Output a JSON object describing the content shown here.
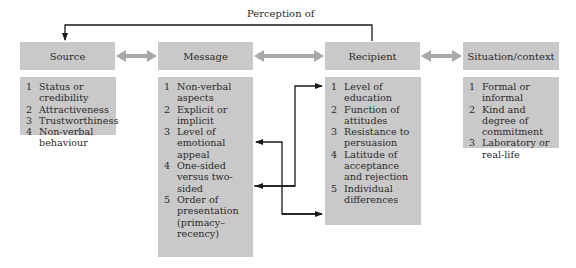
{
  "diagram": {
    "feedback_label": "Perception of",
    "colors": {
      "box": "#c9c9c9",
      "double_arrow": "#a9a9a9",
      "line": "#1a1a1a"
    },
    "columns": [
      {
        "id": "source",
        "title": "Source",
        "items": [
          {
            "n": "1",
            "text": "Status or credibility"
          },
          {
            "n": "2",
            "text": "Attractiveness"
          },
          {
            "n": "3",
            "text": "Trustworthiness"
          },
          {
            "n": "4",
            "text": "Non-verbal behaviour"
          }
        ]
      },
      {
        "id": "message",
        "title": "Message",
        "items": [
          {
            "n": "1",
            "text": "Non-verbal aspects"
          },
          {
            "n": "2",
            "text": "Explicit or implicit"
          },
          {
            "n": "3",
            "text": "Level of emotional appeal"
          },
          {
            "n": "4",
            "text": "One-sided versus two-sided"
          },
          {
            "n": "5",
            "text": "Order of presentation (primacy–recency)"
          }
        ]
      },
      {
        "id": "recipient",
        "title": "Recipient",
        "items": [
          {
            "n": "1",
            "text": "Level of education"
          },
          {
            "n": "2",
            "text": "Function of attitudes"
          },
          {
            "n": "3",
            "text": "Resistance to persuasion"
          },
          {
            "n": "4",
            "text": "Latitude of acceptance and rejection"
          },
          {
            "n": "5",
            "text": "Individual differences"
          }
        ]
      },
      {
        "id": "situation",
        "title": "Situation/context",
        "items": [
          {
            "n": "1",
            "text": "Formal or informal"
          },
          {
            "n": "2",
            "text": "Kind and degree of commitment"
          },
          {
            "n": "3",
            "text": "Laboratory or real-life"
          }
        ]
      }
    ]
  }
}
